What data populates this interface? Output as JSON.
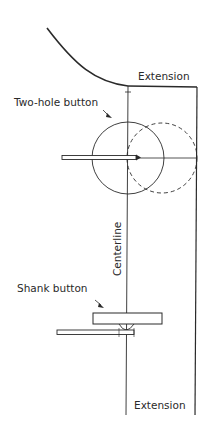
{
  "diagram": {
    "labels": {
      "extension_top": "Extension",
      "two_hole_button": "Two-hole button",
      "centerline": "Centerline",
      "shank_button": "Shank button",
      "extension_bottom": "Extension"
    },
    "colors": {
      "line": "#2a2a2a",
      "background": "#ffffff"
    }
  }
}
